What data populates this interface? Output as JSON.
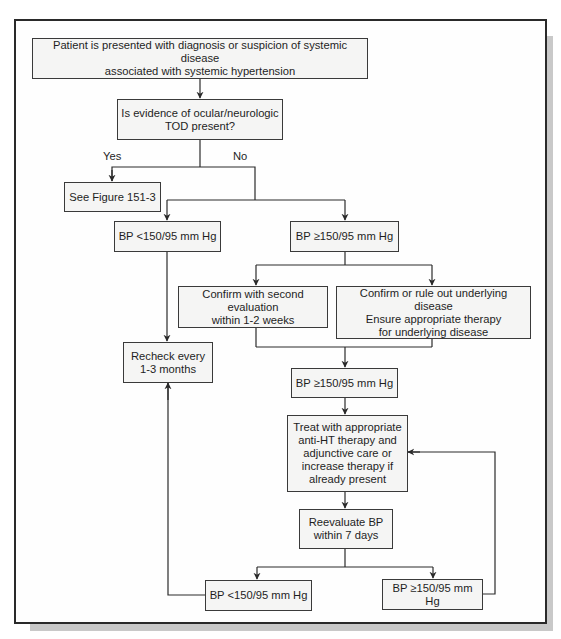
{
  "figure": {
    "nodes": {
      "start": "Patient is presented with diagnosis or suspicion of systemic disease\nassociated with systemic hypertension",
      "tod_question": "Is evidence of ocular/neurologic\nTOD present?",
      "see_figure": "See Figure 151-3",
      "bp_low_1": "BP <150/95 mm Hg",
      "bp_high_1": "BP ≥150/95 mm Hg",
      "confirm_second": "Confirm with second evaluation\nwithin 1-2 weeks",
      "confirm_disease": "Confirm or rule out underlying disease\nEnsure appropriate therapy\nfor underlying disease",
      "recheck": "Recheck every\n1-3 months",
      "bp_high_2": "BP ≥150/95 mm Hg",
      "treat": "Treat with appropriate\nanti-HT therapy and\nadjunctive care or\nincrease therapy if\nalready present",
      "reevaluate": "Reevaluate BP\nwithin 7 days",
      "bp_low_3": "BP <150/95 mm Hg",
      "bp_high_3": "BP ≥150/95 mm Hg"
    },
    "edge_labels": {
      "yes": "Yes",
      "no": "No"
    },
    "colors": {
      "box_fill": "#f5f5f4",
      "line": "#2a2a2a",
      "shadow": "#c9c9c9"
    }
  }
}
